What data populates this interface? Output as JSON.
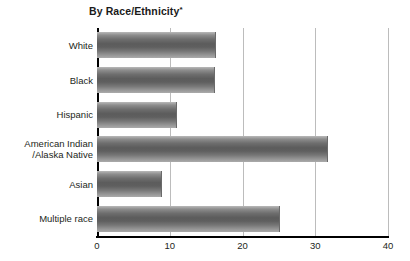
{
  "chart_data": {
    "type": "bar",
    "orientation": "horizontal",
    "title": "By Race/Ethnicity",
    "title_footnote_marker": "*",
    "xlabel": "",
    "ylabel": "",
    "xlim": [
      0,
      40
    ],
    "xticks": [
      0,
      10,
      20,
      30,
      40
    ],
    "xtick_labels": [
      "0",
      "10",
      "20",
      "30",
      "40"
    ],
    "grid": "vertical",
    "legend": "none",
    "categories": [
      "White",
      "Black",
      "Hispanic",
      "American Indian\n/Alaska Native",
      "Asian",
      "Multiple race"
    ],
    "values": [
      16.4,
      16.2,
      11.0,
      31.7,
      8.9,
      25.1
    ],
    "series": [
      {
        "name": "By Race/Ethnicity",
        "values": [
          16.4,
          16.2,
          11.0,
          31.7,
          8.9,
          25.1
        ]
      }
    ],
    "bar_color": "#6e6e6e",
    "gridline_color": "#bcbcbc",
    "axis_color": "#000000"
  }
}
